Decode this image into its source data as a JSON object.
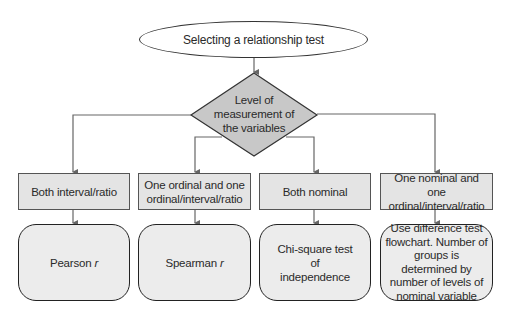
{
  "title": "Selecting a relationship test",
  "decision": {
    "label_lines": [
      "Level of",
      "measurement of",
      "the variables"
    ]
  },
  "branches": [
    {
      "condition": "Both interval/ratio",
      "result": "Pearson",
      "result_symbol": "r"
    },
    {
      "condition": "One ordinal and one ordinal/interval/ratio",
      "result": "Spearman",
      "result_symbol": "r"
    },
    {
      "condition": "Both nominal",
      "result": "Chi-square test of independence",
      "result_symbol": ""
    },
    {
      "condition": "One nominal and one ordinal/interval/ratio",
      "result": "Use difference test flowchart. Number of groups is determined by number of levels of nominal variable",
      "result_symbol": ""
    }
  ],
  "colors": {
    "diamond_fill": "#c8c8c8",
    "rect_fill": "#e4e4e4",
    "rounded_fill": "#ececec",
    "line": "#666666"
  }
}
